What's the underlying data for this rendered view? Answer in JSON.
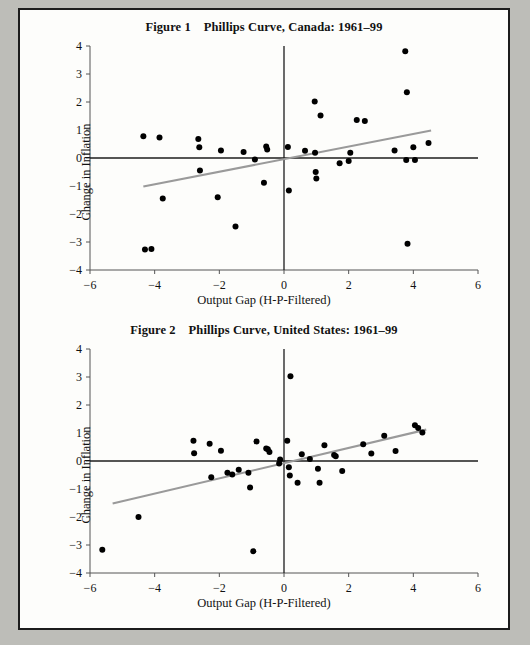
{
  "page": {
    "background_color": "#bdbdb8",
    "sheet_color": "#fdfdfb",
    "border_color": "#1c1c1c"
  },
  "figures": [
    {
      "id": "figure-1",
      "title": "Figure 1    Phillips Curve, Canada: 1961–99",
      "chart_index": 0
    },
    {
      "id": "figure-2",
      "title": "Figure 2    Phillips Curve, United States: 1961–99",
      "chart_index": 1
    }
  ],
  "chart_data": [
    {
      "type": "scatter",
      "title": "Figure 1    Phillips Curve, Canada: 1961–99",
      "xlabel": "Output Gap (H-P-Filtered)",
      "ylabel": "Change in Inflation",
      "xlim": [
        -6,
        6
      ],
      "ylim": [
        -4,
        4
      ],
      "xticks": [
        -6,
        -4,
        -2,
        0,
        2,
        4,
        6
      ],
      "xtick_labels": [
        "−6",
        "−4",
        "−2",
        "0",
        "2",
        "4",
        "6"
      ],
      "yticks": [
        -4,
        -3,
        -2,
        -1,
        0,
        1,
        2,
        3,
        4
      ],
      "ytick_labels": [
        "−4",
        "−3",
        "−2",
        "−1",
        "0",
        "1",
        "2",
        "3",
        "4"
      ],
      "grid": false,
      "legend": "none",
      "marker_color": "#000000",
      "trendline_color": "#9a9a9a",
      "zero_axis_color": "#1c1c1c",
      "points": [
        [
          -4.35,
          0.78
        ],
        [
          -4.3,
          -3.27
        ],
        [
          -4.1,
          -3.25
        ],
        [
          -3.85,
          0.73
        ],
        [
          -3.75,
          -1.45
        ],
        [
          -2.65,
          0.68
        ],
        [
          -2.62,
          0.38
        ],
        [
          -2.6,
          -0.45
        ],
        [
          -2.05,
          -1.4
        ],
        [
          -1.95,
          0.27
        ],
        [
          -1.5,
          -2.45
        ],
        [
          -1.25,
          0.21
        ],
        [
          -0.9,
          -0.05
        ],
        [
          -0.62,
          -0.88
        ],
        [
          -0.55,
          0.41
        ],
        [
          -0.52,
          0.3
        ],
        [
          0.12,
          0.39
        ],
        [
          0.15,
          -1.16
        ],
        [
          0.65,
          0.26
        ],
        [
          0.95,
          2.02
        ],
        [
          0.96,
          0.19
        ],
        [
          0.98,
          -0.5
        ],
        [
          1.0,
          -0.73
        ],
        [
          1.13,
          1.52
        ],
        [
          1.72,
          -0.19
        ],
        [
          2.0,
          -0.11
        ],
        [
          2.05,
          0.19
        ],
        [
          2.25,
          1.36
        ],
        [
          2.5,
          1.32
        ],
        [
          3.42,
          0.27
        ],
        [
          3.75,
          3.81
        ],
        [
          3.78,
          -0.07
        ],
        [
          3.8,
          2.35
        ],
        [
          3.82,
          -3.06
        ],
        [
          4.0,
          0.38
        ],
        [
          4.05,
          -0.07
        ],
        [
          4.47,
          0.54
        ]
      ],
      "trendline": {
        "x0": -4.35,
        "y0": -1.02,
        "x1": 4.55,
        "y1": 0.98
      }
    },
    {
      "type": "scatter",
      "title": "Figure 2    Phillips Curve, United States: 1961–99",
      "xlabel": "Output Gap (H-P-Filtered)",
      "ylabel": "Change in Inflation",
      "xlim": [
        -6,
        6
      ],
      "ylim": [
        -4,
        4
      ],
      "xticks": [
        -6,
        -4,
        -2,
        0,
        2,
        4,
        6
      ],
      "xtick_labels": [
        "−6",
        "−4",
        "−2",
        "0",
        "2",
        "4",
        "6"
      ],
      "yticks": [
        -4,
        -3,
        -2,
        -1,
        0,
        1,
        2,
        3,
        4
      ],
      "ytick_labels": [
        "−4",
        "−3",
        "−2",
        "−1",
        "0",
        "1",
        "2",
        "3",
        "4"
      ],
      "grid": false,
      "legend": "none",
      "marker_color": "#000000",
      "trendline_color": "#9a9a9a",
      "zero_axis_color": "#1c1c1c",
      "points": [
        [
          -5.62,
          -3.17
        ],
        [
          -4.5,
          -2.0
        ],
        [
          -2.8,
          0.72
        ],
        [
          -2.78,
          0.28
        ],
        [
          -2.3,
          0.62
        ],
        [
          -2.25,
          -0.58
        ],
        [
          -1.95,
          0.37
        ],
        [
          -1.75,
          -0.42
        ],
        [
          -1.6,
          -0.48
        ],
        [
          -1.4,
          -0.31
        ],
        [
          -1.1,
          -0.42
        ],
        [
          -1.05,
          -0.95
        ],
        [
          -0.95,
          -3.22
        ],
        [
          -0.85,
          0.7
        ],
        [
          -0.55,
          0.45
        ],
        [
          -0.5,
          0.42
        ],
        [
          -0.45,
          0.32
        ],
        [
          -0.15,
          -0.09
        ],
        [
          -0.12,
          0.05
        ],
        [
          0.1,
          0.72
        ],
        [
          0.15,
          -0.22
        ],
        [
          0.18,
          -0.52
        ],
        [
          0.2,
          3.03
        ],
        [
          0.42,
          -0.78
        ],
        [
          0.55,
          0.24
        ],
        [
          0.8,
          0.07
        ],
        [
          1.05,
          -0.28
        ],
        [
          1.1,
          -0.78
        ],
        [
          1.25,
          0.56
        ],
        [
          1.55,
          0.21
        ],
        [
          1.6,
          0.17
        ],
        [
          1.8,
          -0.36
        ],
        [
          2.45,
          0.6
        ],
        [
          2.7,
          0.27
        ],
        [
          3.1,
          0.9
        ],
        [
          3.45,
          0.36
        ],
        [
          4.05,
          1.28
        ],
        [
          4.15,
          1.18
        ],
        [
          4.28,
          1.02
        ]
      ],
      "trendline": {
        "x0": -5.3,
        "y0": -1.52,
        "x1": 4.4,
        "y1": 1.12
      }
    }
  ]
}
